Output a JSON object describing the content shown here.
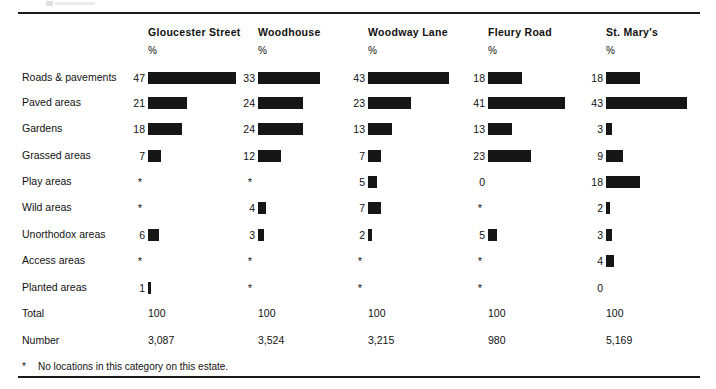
{
  "top_artifact": {
    "name": "clipped-page-header-fragment"
  },
  "footnote": {
    "marker": "*",
    "text": "No locations in this category on this estate."
  },
  "table": {
    "row_header_label": "",
    "percent_symbol": "%",
    "columns": [
      {
        "name": "Gloucester Street",
        "unit": "%"
      },
      {
        "name": "Woodhouse",
        "unit": "%"
      },
      {
        "name": "Woodway Lane",
        "unit": "%"
      },
      {
        "name": "Fleury Road",
        "unit": "%"
      },
      {
        "name": "St. Mary's",
        "unit": "%"
      }
    ],
    "rows": [
      {
        "label": "Roads & pavements",
        "values": [
          "47",
          "33",
          "43",
          "18",
          "18"
        ]
      },
      {
        "label": "Paved areas",
        "values": [
          "21",
          "24",
          "23",
          "41",
          "43"
        ]
      },
      {
        "label": "Gardens",
        "values": [
          "18",
          "24",
          "13",
          "13",
          "3"
        ]
      },
      {
        "label": "Grassed areas",
        "values": [
          "7",
          "12",
          "7",
          "23",
          "9"
        ]
      },
      {
        "label": "Play areas",
        "values": [
          "*",
          "*",
          "5",
          "0",
          "18"
        ]
      },
      {
        "label": "Wild areas",
        "values": [
          "*",
          "4",
          "7",
          "*",
          "2"
        ]
      },
      {
        "label": "Unorthodox areas",
        "values": [
          "6",
          "3",
          "2",
          "5",
          "3"
        ]
      },
      {
        "label": "Access areas",
        "values": [
          "*",
          "*",
          "*",
          "*",
          "4"
        ]
      },
      {
        "label": "Planted areas",
        "values": [
          "1",
          "*",
          "*",
          "*",
          "0"
        ]
      }
    ],
    "total_row": {
      "label": "Total",
      "values": [
        "100",
        "100",
        "100",
        "100",
        "100"
      ]
    },
    "number_row": {
      "label": "Number",
      "values": [
        "3,087",
        "3,524",
        "3,215",
        "980",
        "5,169"
      ]
    }
  },
  "chart_data": {
    "type": "bar",
    "title": "",
    "xlabel": "%",
    "ylabel": "",
    "orientation": "horizontal",
    "grid": false,
    "legend": "none",
    "xlim": [
      0,
      50
    ],
    "categories": [
      "Roads & pavements",
      "Paved areas",
      "Gardens",
      "Grassed areas",
      "Play areas",
      "Wild areas",
      "Unorthodox areas",
      "Access areas",
      "Planted areas"
    ],
    "series": [
      {
        "name": "Gloucester Street",
        "unit": "%",
        "values": [
          47,
          21,
          18,
          7,
          null,
          null,
          6,
          null,
          1
        ],
        "total": 100,
        "number": 3087
      },
      {
        "name": "Woodhouse",
        "unit": "%",
        "values": [
          33,
          24,
          24,
          12,
          null,
          4,
          3,
          null,
          null
        ],
        "total": 100,
        "number": 3524
      },
      {
        "name": "Woodway Lane",
        "unit": "%",
        "values": [
          43,
          23,
          13,
          7,
          5,
          7,
          2,
          null,
          null
        ],
        "total": 100,
        "number": 3215
      },
      {
        "name": "Fleury Road",
        "unit": "%",
        "values": [
          18,
          41,
          13,
          23,
          0,
          null,
          5,
          null,
          null
        ],
        "total": 100,
        "number": 980
      },
      {
        "name": "St. Mary's",
        "unit": "%",
        "values": [
          18,
          43,
          3,
          9,
          18,
          2,
          3,
          4,
          0
        ],
        "total": 100,
        "number": 5169
      }
    ],
    "null_marker": "*",
    "null_marker_meaning": "No locations in this category on this estate.",
    "bar_color": "#161616"
  }
}
